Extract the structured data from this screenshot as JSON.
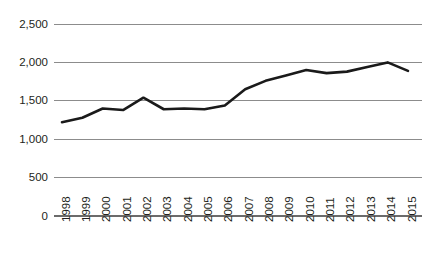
{
  "chart_data": {
    "type": "line",
    "title": "",
    "subtitle": "",
    "xlabel": "",
    "ylabel": "",
    "categories": [
      "1998",
      "1999",
      "2000",
      "2001",
      "2002",
      "2003",
      "2004",
      "2005",
      "2006",
      "2007",
      "2008",
      "2009",
      "2010",
      "2011",
      "2012",
      "2013",
      "2014",
      "2015"
    ],
    "values": [
      1220,
      1280,
      1400,
      1380,
      1540,
      1390,
      1400,
      1390,
      1440,
      1650,
      1760,
      1830,
      1900,
      1860,
      1880,
      1940,
      2000,
      1890
    ],
    "series": [
      {
        "name": "",
        "values": [
          1220,
          1280,
          1400,
          1380,
          1540,
          1390,
          1400,
          1390,
          1440,
          1650,
          1760,
          1830,
          1900,
          1860,
          1880,
          1940,
          2000,
          1890
        ],
        "color": "#1a1a1a"
      }
    ],
    "ylim": [
      0,
      2500
    ],
    "yticks": [
      0,
      500,
      1000,
      1500,
      2000,
      2500
    ],
    "ytick_labels": [
      "0",
      "500",
      "1,000",
      "1,500",
      "2,000",
      "2,500"
    ],
    "xtick_labels": [
      "1998",
      "1999",
      "2000",
      "2001",
      "2002",
      "2003",
      "2004",
      "2005",
      "2006",
      "2007",
      "2008",
      "2009",
      "2010",
      "2011",
      "2012",
      "2013",
      "2014",
      "2015"
    ],
    "grid": true,
    "grid_axis": "y",
    "legend": false,
    "legend_position": "none",
    "annotations": [],
    "colors": {
      "line": "#1a1a1a",
      "grid": "#8c8c8c",
      "axis": "#6b6b6b",
      "text": "#231f20",
      "background": "#ffffff"
    },
    "xtick_label_rotation": -90
  }
}
